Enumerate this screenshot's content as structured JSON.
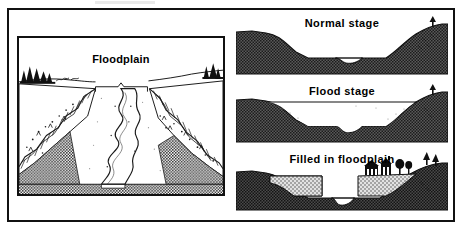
{
  "figure": {
    "left_illustration": {
      "label": "Floodplain",
      "caption_bracket": "floodplain-width-bracket",
      "scene": "perspective cutaway of a meandering river valley with terraced bluffs and trees on the rim"
    },
    "cross_sections": [
      {
        "title": "Normal stage",
        "water_level": "low",
        "description": "River confined to a narrow channel in the center of the valley floor"
      },
      {
        "title": "Flood stage",
        "water_level": "high",
        "description": "Water spreads across the entire floodplain from bluff to bluff"
      },
      {
        "title": "Filled in floodplain",
        "water_level": "low",
        "description": "Artificial fill placed on both sides of the narrowed channel with buildings on top"
      }
    ]
  },
  "colors": {
    "ink": "#111111",
    "ground_dark": "#3a3a3a",
    "fill_light": "#cfcfcf",
    "water": "#ffffff",
    "paper": "#ffffff"
  }
}
